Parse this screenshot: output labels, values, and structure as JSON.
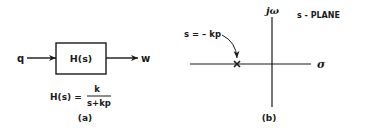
{
  "panel_a": {
    "input_label": "q",
    "output_label": "w",
    "block_label": "H(s)",
    "formula_lhs": "H(s) =",
    "formula_numerator": "k",
    "formula_denominator": "s+kp",
    "caption": "(a)"
  },
  "panel_b": {
    "plane_label": "s - PLANE",
    "vertical_axis_label": "jω",
    "horizontal_axis_label": "σ",
    "pole_label": "s = – kp",
    "pole_marker": "×",
    "caption": "(b)"
  }
}
